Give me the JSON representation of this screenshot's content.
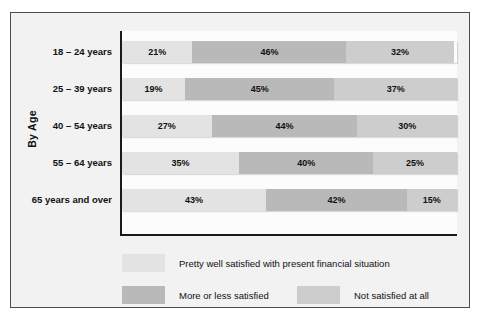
{
  "chart_data": {
    "type": "bar",
    "subtype": "horizontal-stacked-100",
    "title": "",
    "xlabel": "",
    "ylabel": "By Age",
    "grid": false,
    "legend_position": "bottom",
    "xlim": [
      0,
      100
    ],
    "categories": [
      "18 – 24 years",
      "25 – 39 years",
      "40 – 54 years",
      "55 – 64 years",
      "65 years and over"
    ],
    "series": [
      {
        "name": "Pretty well satisfied with present financial situation",
        "color": "#e3e3e3",
        "values": [
          21,
          19,
          27,
          35,
          43
        ],
        "labels": [
          "21%",
          "19%",
          "27%",
          "35%",
          "43%"
        ]
      },
      {
        "name": "More or less satisfied",
        "color": "#b9b9b9",
        "values": [
          46,
          45,
          44,
          40,
          42
        ],
        "labels": [
          "46%",
          "45%",
          "44%",
          "40%",
          "42%"
        ]
      },
      {
        "name": "Not satisfied at all",
        "color": "#cdcdcd",
        "values": [
          32,
          37,
          30,
          25,
          15
        ],
        "labels": [
          "32%",
          "37%",
          "30%",
          "25%",
          "15%"
        ]
      }
    ]
  },
  "axis": {
    "group_title": "By Age"
  },
  "rows": [
    {
      "label": "18 – 24 years",
      "a": 21,
      "b": 46,
      "c": 32,
      "a_label": "21%",
      "b_label": "46%",
      "c_label": "32%"
    },
    {
      "label": "25 – 39 years",
      "a": 19,
      "b": 45,
      "c": 37,
      "a_label": "19%",
      "b_label": "45%",
      "c_label": "37%"
    },
    {
      "label": "40 – 54 years",
      "a": 27,
      "b": 44,
      "c": 30,
      "a_label": "27%",
      "b_label": "44%",
      "c_label": "30%"
    },
    {
      "label": "55 – 64 years",
      "a": 35,
      "b": 40,
      "c": 25,
      "a_label": "35%",
      "b_label": "40%",
      "c_label": "25%"
    },
    {
      "label": "65 years and over",
      "a": 43,
      "b": 42,
      "c": 15,
      "a_label": "43%",
      "b_label": "42%",
      "c_label": "15%"
    }
  ],
  "legend": {
    "items": [
      {
        "label": "Pretty well satisfied with present financial situation",
        "color": "#e3e3e3"
      },
      {
        "label": "More or less satisfied",
        "color": "#b9b9b9"
      },
      {
        "label": "Not satisfied at all",
        "color": "#cdcdcd"
      }
    ]
  },
  "colors": {
    "series_a": "#e3e3e3",
    "series_b": "#b9b9b9",
    "series_c": "#cdcdcd",
    "frame_border": "#4d4d4d",
    "card_background": "#f2f2f2",
    "plot_background": "#fcfcfc",
    "axis": "#1a1a1a",
    "text": "#111111"
  }
}
